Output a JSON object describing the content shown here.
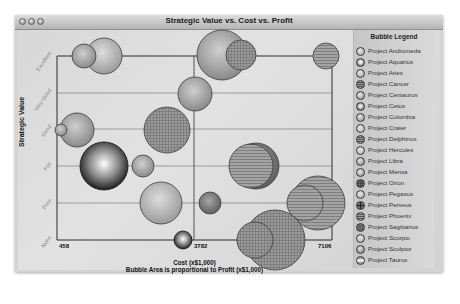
{
  "window": {
    "title": "Strategic Value vs. Cost vs. Profit",
    "controls": [
      "close",
      "minimize",
      "zoom"
    ]
  },
  "chart_data": {
    "type": "bubble",
    "title": "Strategic Value vs. Cost vs. Profit",
    "xlabel": "Cost (x$1,000)",
    "xlabel_sub": "Bubble Area is proportional to Profit (x$1,000)",
    "ylabel": "Strategic Value",
    "x_ticks": [
      458,
      3782,
      7106
    ],
    "xlim": [
      458,
      7106
    ],
    "y_categories": [
      "None",
      "Poor",
      "Fair",
      "Good",
      "Very Good",
      "Excellent"
    ],
    "grid": true,
    "legend_position": "right",
    "legend_title": "Bubble Legend",
    "series": [
      {
        "name": "Project Andromeda",
        "x": 1450,
        "y": "Excellent",
        "r": 18
      },
      {
        "name": "Project Aquarius",
        "x": 1500,
        "y": "Fair",
        "r": 24
      },
      {
        "name": "Project Aries",
        "x": 3800,
        "y": "Fair",
        "r": 10
      },
      {
        "name": "Project Cancer",
        "x": 5650,
        "y": "Good",
        "r": 20
      },
      {
        "name": "Project Centaurus",
        "x": 1250,
        "y": "Good",
        "r": 16
      },
      {
        "name": "Project Cetus",
        "x": 3782,
        "y": "None",
        "r": 8
      },
      {
        "name": "Project Columbia",
        "x": 5900,
        "y": "Good",
        "r": 22
      },
      {
        "name": "Project Crater",
        "x": 3900,
        "y": "Poor",
        "r": 21
      },
      {
        "name": "Project Delphinus",
        "x": 6800,
        "y": "Fair",
        "r": 27
      },
      {
        "name": "Project Hercules",
        "x": 5450,
        "y": "Excellent",
        "r": 25
      },
      {
        "name": "Project Libra",
        "x": 930,
        "y": "Excellent",
        "r": 12
      },
      {
        "name": "Project Mensa",
        "x": 4800,
        "y": "Very Good",
        "r": 17
      },
      {
        "name": "Project Orion",
        "x": 4000,
        "y": "Good",
        "r": 23
      },
      {
        "name": "Project Pegasus",
        "x": 750,
        "y": "Good",
        "r": 5
      },
      {
        "name": "Project Perseus",
        "x": 5100,
        "y": "Poor",
        "r": 8
      },
      {
        "name": "Project Phoenix",
        "x": 5300,
        "y": "Fair",
        "r": 20
      },
      {
        "name": "Project Sagittarius",
        "x": 7100,
        "y": "Excellent",
        "r": 13
      },
      {
        "name": "Project Scorpio",
        "x": 2900,
        "y": "Fair",
        "r": 11
      },
      {
        "name": "Project Sculptor",
        "x": 5900,
        "y": "None",
        "r": 20
      },
      {
        "name": "Project Taurus",
        "x": 6300,
        "y": "Fair",
        "r": 18
      }
    ]
  },
  "legend": {
    "title": "Bubble Legend",
    "items": [
      {
        "label": "Project Andromeda",
        "fill": "#a8a8a8",
        "pattern": "plain"
      },
      {
        "label": "Project Aquarius",
        "fill": "#d0d0d0",
        "pattern": "dark-ring"
      },
      {
        "label": "Project Aries",
        "fill": "#a0a0a0",
        "pattern": "plain"
      },
      {
        "label": "Project Cancer",
        "fill": "#969696",
        "pattern": "hlines"
      },
      {
        "label": "Project Centaurus",
        "fill": "#8e8e8e",
        "pattern": "plain"
      },
      {
        "label": "Project Cetus",
        "fill": "#c8c8c8",
        "pattern": "dark-ring"
      },
      {
        "label": "Project Columbia",
        "fill": "#8a8a8a",
        "pattern": "plain"
      },
      {
        "label": "Project Crater",
        "fill": "#b0b0b0",
        "pattern": "plain"
      },
      {
        "label": "Project Delphinus",
        "fill": "#9a9a9a",
        "pattern": "hlines"
      },
      {
        "label": "Project Hercules",
        "fill": "#b4b4b4",
        "pattern": "plain"
      },
      {
        "label": "Project Libra",
        "fill": "#7e7e7e",
        "pattern": "plain"
      },
      {
        "label": "Project Mensa",
        "fill": "#909090",
        "pattern": "plain"
      },
      {
        "label": "Project Orion",
        "fill": "#8c8c8c",
        "pattern": "grid"
      },
      {
        "label": "Project Pegasus",
        "fill": "#a6a6a6",
        "pattern": "plain"
      },
      {
        "label": "Project Perseus",
        "fill": "#6e6e6e",
        "pattern": "cross"
      },
      {
        "label": "Project Phoenix",
        "fill": "#a2a2a2",
        "pattern": "hlines"
      },
      {
        "label": "Project Sagittarius",
        "fill": "#7a7a7a",
        "pattern": "hlines"
      },
      {
        "label": "Project Scorpio",
        "fill": "#a8a8a8",
        "pattern": "plain"
      },
      {
        "label": "Project Sculptor",
        "fill": "#6c6c6c",
        "pattern": "plain"
      },
      {
        "label": "Project Taurus",
        "fill": "#9c9c9c",
        "pattern": "band"
      }
    ]
  },
  "axes": {
    "ylabel": "Strategic Value",
    "y_ticks": [
      "Excellent",
      "Very Good",
      "Good",
      "Fair",
      "Poor",
      "None"
    ],
    "x_ticks": [
      "458",
      "3782",
      "7106"
    ],
    "xlabel": "Cost (x$1,000)",
    "xlabel_sub": "Bubble Area is proportional to Profit (x$1,000)"
  }
}
